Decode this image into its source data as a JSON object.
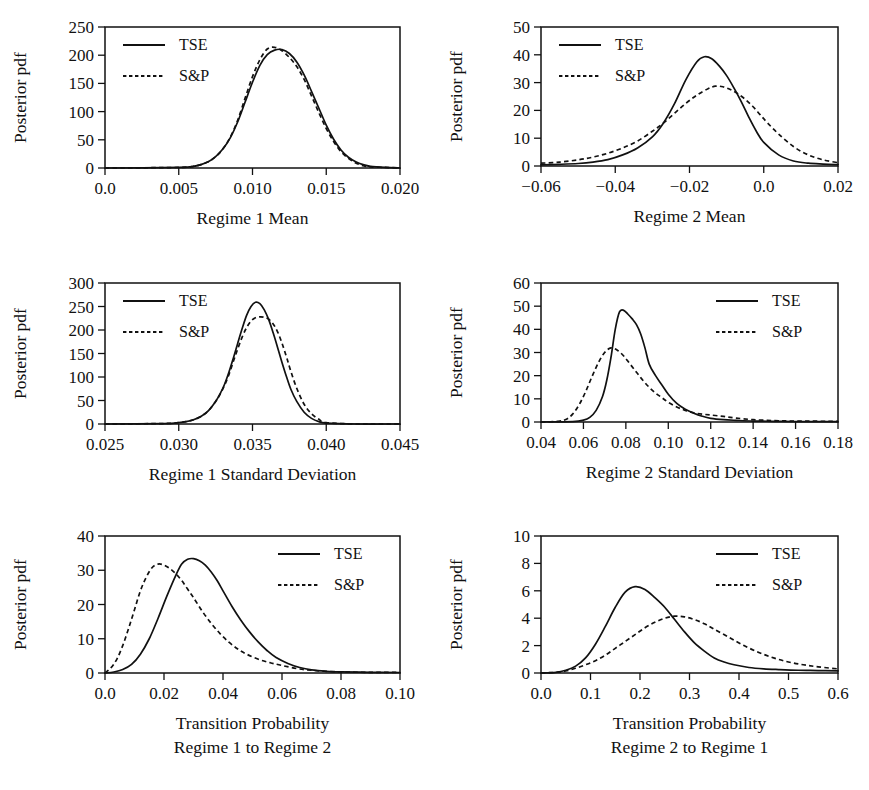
{
  "figure": {
    "ylabel": "Posterior pdf",
    "legend": {
      "series1": "TSE",
      "series2": "S&P"
    }
  },
  "chart_data": [
    {
      "id": "regime1-mean",
      "type": "line",
      "title": "",
      "xlabel": "Regime 1 Mean",
      "ylabel": "Posterior pdf",
      "xlim": [
        0.0,
        0.02
      ],
      "ylim": [
        0,
        250
      ],
      "xticks": [
        0.0,
        0.005,
        0.01,
        0.015,
        0.02
      ],
      "xticklabels": [
        "0.0",
        "0.005",
        "0.010",
        "0.015",
        "0.020"
      ],
      "yticks": [
        0,
        50,
        100,
        150,
        200,
        250
      ],
      "yticklabels": [
        "0",
        "50",
        "100",
        "150",
        "200",
        "250"
      ],
      "grid": false,
      "legend_position": "top-left",
      "series": [
        {
          "name": "TSE",
          "style": "solid",
          "x": [
            0.0,
            0.005,
            0.006,
            0.0065,
            0.007,
            0.0075,
            0.008,
            0.0085,
            0.009,
            0.0095,
            0.01,
            0.0105,
            0.011,
            0.0115,
            0.012,
            0.0125,
            0.013,
            0.0135,
            0.014,
            0.0145,
            0.015,
            0.0155,
            0.016,
            0.0165,
            0.017,
            0.0175,
            0.018,
            0.019,
            0.02
          ],
          "y": [
            0,
            1,
            3,
            6,
            11,
            20,
            34,
            54,
            82,
            117,
            152,
            182,
            201,
            209,
            210,
            203,
            188,
            165,
            136,
            106,
            76,
            51,
            32,
            19,
            11,
            6,
            3,
            1,
            0
          ]
        },
        {
          "name": "S&P",
          "style": "dashed",
          "x": [
            0.0,
            0.005,
            0.006,
            0.0065,
            0.007,
            0.0075,
            0.008,
            0.0085,
            0.009,
            0.0095,
            0.01,
            0.0105,
            0.011,
            0.0115,
            0.012,
            0.0125,
            0.013,
            0.0135,
            0.014,
            0.0145,
            0.015,
            0.0155,
            0.016,
            0.0165,
            0.017,
            0.0175,
            0.018,
            0.019,
            0.02
          ],
          "y": [
            0,
            1,
            3,
            6,
            11,
            20,
            34,
            55,
            85,
            124,
            162,
            192,
            211,
            214,
            208,
            196,
            180,
            157,
            128,
            98,
            70,
            47,
            29,
            17,
            9,
            4,
            2,
            1,
            0
          ]
        }
      ]
    },
    {
      "id": "regime2-mean",
      "type": "line",
      "title": "",
      "xlabel": "Regime 2 Mean",
      "ylabel": "Posterior pdf",
      "xlim": [
        -0.06,
        0.02
      ],
      "ylim": [
        0,
        50
      ],
      "xticks": [
        -0.06,
        -0.04,
        -0.02,
        0.0,
        0.02
      ],
      "xticklabels": [
        "−0.06",
        "−0.04",
        "−0.02",
        "0.0",
        "0.02"
      ],
      "yticks": [
        0,
        10,
        20,
        30,
        40,
        50
      ],
      "yticklabels": [
        "0",
        "10",
        "20",
        "30",
        "40",
        "50"
      ],
      "grid": false,
      "legend_position": "top-left",
      "series": [
        {
          "name": "TSE",
          "style": "solid",
          "x": [
            -0.06,
            -0.055,
            -0.05,
            -0.046,
            -0.042,
            -0.038,
            -0.034,
            -0.03,
            -0.027,
            -0.024,
            -0.021,
            -0.018,
            -0.016,
            -0.014,
            -0.012,
            -0.01,
            -0.008,
            -0.006,
            -0.004,
            -0.002,
            0.0,
            0.004,
            0.008,
            0.012,
            0.016,
            0.02
          ],
          "y": [
            0.4,
            0.6,
            0.9,
            1.4,
            2.3,
            4.0,
            6.5,
            10.5,
            15.5,
            22.5,
            31.0,
            37.5,
            39.3,
            38.6,
            36.0,
            32.5,
            28.0,
            23.0,
            17.5,
            12.5,
            8.5,
            4.0,
            1.8,
            1.0,
            0.7,
            0.5
          ]
        },
        {
          "name": "S&P",
          "style": "dashed",
          "x": [
            -0.06,
            -0.055,
            -0.05,
            -0.046,
            -0.042,
            -0.038,
            -0.034,
            -0.03,
            -0.027,
            -0.024,
            -0.021,
            -0.018,
            -0.015,
            -0.013,
            -0.011,
            -0.009,
            -0.007,
            -0.005,
            -0.003,
            -0.001,
            0.001,
            0.004,
            0.008,
            0.012,
            0.016,
            0.02
          ],
          "y": [
            1.0,
            1.4,
            2.2,
            3.2,
            4.6,
            6.5,
            9.0,
            12.5,
            15.5,
            19.0,
            22.5,
            25.5,
            27.8,
            28.7,
            28.5,
            27.5,
            26.0,
            24.0,
            21.5,
            18.5,
            15.5,
            11.5,
            7.0,
            4.0,
            2.2,
            1.2
          ]
        }
      ]
    },
    {
      "id": "regime1-sd",
      "type": "line",
      "title": "",
      "xlabel": "Regime 1 Standard Deviation",
      "ylabel": "Posterior pdf",
      "xlim": [
        0.025,
        0.045
      ],
      "ylim": [
        0,
        300
      ],
      "xticks": [
        0.025,
        0.03,
        0.035,
        0.04,
        0.045
      ],
      "xticklabels": [
        "0.025",
        "0.030",
        "0.035",
        "0.040",
        "0.045"
      ],
      "yticks": [
        0,
        50,
        100,
        150,
        200,
        250,
        300
      ],
      "yticklabels": [
        "0",
        "50",
        "100",
        "150",
        "200",
        "250",
        "300"
      ],
      "grid": false,
      "legend_position": "top-left",
      "series": [
        {
          "name": "TSE",
          "style": "solid",
          "x": [
            0.025,
            0.029,
            0.03,
            0.0305,
            0.031,
            0.0315,
            0.032,
            0.0325,
            0.0328,
            0.0331,
            0.0334,
            0.0337,
            0.034,
            0.0343,
            0.0346,
            0.0349,
            0.0352,
            0.0355,
            0.0358,
            0.0361,
            0.0364,
            0.0367,
            0.037,
            0.0373,
            0.0376,
            0.038,
            0.0385,
            0.039,
            0.0395,
            0.04,
            0.042,
            0.045
          ],
          "y": [
            0,
            1,
            3,
            5,
            9,
            16,
            28,
            48,
            64,
            84,
            110,
            140,
            172,
            203,
            231,
            250,
            259,
            256,
            243,
            222,
            194,
            163,
            131,
            101,
            74,
            48,
            25,
            12,
            5,
            2,
            0,
            0
          ]
        },
        {
          "name": "S&P",
          "style": "dashed",
          "x": [
            0.025,
            0.029,
            0.03,
            0.0305,
            0.031,
            0.0315,
            0.032,
            0.0325,
            0.0328,
            0.0331,
            0.0334,
            0.0337,
            0.034,
            0.0343,
            0.0346,
            0.0349,
            0.0352,
            0.0355,
            0.0358,
            0.0361,
            0.0364,
            0.0367,
            0.037,
            0.0373,
            0.0376,
            0.038,
            0.0385,
            0.039,
            0.0395,
            0.04,
            0.042,
            0.045
          ],
          "y": [
            0,
            1,
            3,
            5,
            9,
            16,
            28,
            48,
            63,
            82,
            105,
            133,
            160,
            185,
            205,
            219,
            226,
            228,
            227,
            223,
            213,
            196,
            172,
            143,
            112,
            76,
            42,
            22,
            10,
            3,
            0,
            0
          ]
        }
      ]
    },
    {
      "id": "regime2-sd",
      "type": "line",
      "title": "",
      "xlabel": "Regime 2 Standard Deviation",
      "ylabel": "Posterior pdf",
      "xlim": [
        0.04,
        0.18
      ],
      "ylim": [
        0,
        60
      ],
      "xticks": [
        0.04,
        0.06,
        0.08,
        0.1,
        0.12,
        0.14,
        0.16,
        0.18
      ],
      "xticklabels": [
        "0.04",
        "0.06",
        "0.08",
        "0.10",
        "0.12",
        "0.14",
        "0.16",
        "0.18"
      ],
      "yticks": [
        0,
        10,
        20,
        30,
        40,
        50,
        60
      ],
      "yticklabels": [
        "0",
        "10",
        "20",
        "30",
        "40",
        "50",
        "60"
      ],
      "grid": false,
      "legend_position": "top-right",
      "series": [
        {
          "name": "TSE",
          "style": "solid",
          "x": [
            0.04,
            0.055,
            0.06,
            0.063,
            0.066,
            0.069,
            0.071,
            0.073,
            0.075,
            0.077,
            0.079,
            0.081,
            0.083,
            0.085,
            0.087,
            0.089,
            0.091,
            0.094,
            0.097,
            0.1,
            0.104,
            0.108,
            0.112,
            0.116,
            0.12,
            0.126,
            0.132,
            0.14,
            0.15,
            0.16,
            0.18
          ],
          "y": [
            0,
            0.2,
            0.8,
            2.0,
            5.0,
            11.0,
            18.0,
            28.0,
            40.0,
            47.5,
            48.2,
            46.5,
            44.5,
            42.0,
            38.0,
            32.0,
            25.0,
            20.0,
            16.0,
            12.0,
            8.0,
            5.5,
            3.8,
            2.5,
            1.6,
            1.0,
            0.7,
            0.4,
            0.3,
            0.2,
            0.2
          ]
        },
        {
          "name": "S&P",
          "style": "dashed",
          "x": [
            0.04,
            0.048,
            0.052,
            0.055,
            0.058,
            0.061,
            0.064,
            0.067,
            0.07,
            0.073,
            0.076,
            0.079,
            0.082,
            0.085,
            0.088,
            0.091,
            0.094,
            0.097,
            0.1,
            0.104,
            0.108,
            0.112,
            0.116,
            0.12,
            0.126,
            0.132,
            0.14,
            0.15,
            0.16,
            0.18
          ],
          "y": [
            0,
            0.3,
            1.2,
            3.5,
            7.5,
            13.0,
            19.5,
            25.5,
            30.0,
            32.0,
            31.0,
            28.5,
            25.0,
            21.5,
            18.0,
            15.0,
            12.5,
            10.5,
            8.5,
            6.5,
            5.0,
            4.0,
            3.4,
            3.0,
            2.4,
            1.7,
            1.0,
            0.6,
            0.4,
            0.3
          ]
        }
      ]
    },
    {
      "id": "transition-1to2",
      "type": "line",
      "title": "",
      "xlabel": "Transition Probability",
      "xlabel2": "Regime 1 to Regime 2",
      "ylabel": "Posterior pdf",
      "xlim": [
        0.0,
        0.1
      ],
      "ylim": [
        0,
        40
      ],
      "xticks": [
        0.0,
        0.02,
        0.04,
        0.06,
        0.08,
        0.1
      ],
      "xticklabels": [
        "0.0",
        "0.02",
        "0.04",
        "0.06",
        "0.08",
        "0.10"
      ],
      "yticks": [
        0,
        10,
        20,
        30,
        40
      ],
      "yticklabels": [
        "0",
        "10",
        "20",
        "30",
        "40"
      ],
      "grid": false,
      "legend_position": "top-right",
      "series": [
        {
          "name": "TSE",
          "style": "solid",
          "x": [
            0.0,
            0.003,
            0.006,
            0.009,
            0.012,
            0.015,
            0.018,
            0.021,
            0.024,
            0.026,
            0.028,
            0.03,
            0.032,
            0.034,
            0.036,
            0.038,
            0.04,
            0.043,
            0.046,
            0.049,
            0.052,
            0.055,
            0.058,
            0.062,
            0.066,
            0.07,
            0.075,
            0.08,
            0.09,
            0.1
          ],
          "y": [
            0,
            0.3,
            1.0,
            2.5,
            5.5,
            10.0,
            16.0,
            22.5,
            28.5,
            31.8,
            33.2,
            33.4,
            32.8,
            31.5,
            29.5,
            27.0,
            24.0,
            19.5,
            15.5,
            12.0,
            9.0,
            6.5,
            4.5,
            2.8,
            1.6,
            0.9,
            0.5,
            0.3,
            0.2,
            0.15
          ]
        },
        {
          "name": "S&P",
          "style": "dashed",
          "x": [
            0.0,
            0.002,
            0.004,
            0.006,
            0.008,
            0.01,
            0.012,
            0.014,
            0.016,
            0.018,
            0.02,
            0.022,
            0.024,
            0.026,
            0.028,
            0.03,
            0.033,
            0.036,
            0.039,
            0.042,
            0.045,
            0.048,
            0.052,
            0.056,
            0.06,
            0.065,
            0.07,
            0.08,
            0.09,
            0.1
          ],
          "y": [
            0,
            1.5,
            4.0,
            8.0,
            13.0,
            18.5,
            24.0,
            28.0,
            30.8,
            31.8,
            31.5,
            30.5,
            29.0,
            27.0,
            24.5,
            22.0,
            18.0,
            14.5,
            11.5,
            9.0,
            7.0,
            5.5,
            4.0,
            3.0,
            2.2,
            1.3,
            0.8,
            0.3,
            0.2,
            0.15
          ]
        }
      ]
    },
    {
      "id": "transition-2to1",
      "type": "line",
      "title": "",
      "xlabel": "Transition Probability",
      "xlabel2": "Regime 2 to Regime 1",
      "ylabel": "Posterior pdf",
      "xlim": [
        0.0,
        0.6
      ],
      "ylim": [
        0,
        10
      ],
      "xticks": [
        0.0,
        0.1,
        0.2,
        0.3,
        0.4,
        0.5,
        0.6
      ],
      "xticklabels": [
        "0.0",
        "0.1",
        "0.2",
        "0.3",
        "0.4",
        "0.5",
        "0.6"
      ],
      "yticks": [
        0,
        2,
        4,
        6,
        8,
        10
      ],
      "yticklabels": [
        "0",
        "2",
        "4",
        "6",
        "8",
        "10"
      ],
      "grid": false,
      "legend_position": "top-right",
      "series": [
        {
          "name": "TSE",
          "style": "solid",
          "x": [
            0.0,
            0.03,
            0.05,
            0.07,
            0.09,
            0.11,
            0.13,
            0.15,
            0.17,
            0.19,
            0.21,
            0.23,
            0.25,
            0.27,
            0.29,
            0.31,
            0.33,
            0.35,
            0.37,
            0.39,
            0.42,
            0.45,
            0.48,
            0.52,
            0.56,
            0.6
          ],
          "y": [
            0,
            0.05,
            0.2,
            0.5,
            1.1,
            2.1,
            3.4,
            4.8,
            5.9,
            6.3,
            6.1,
            5.5,
            4.8,
            3.9,
            3.0,
            2.2,
            1.6,
            1.1,
            0.8,
            0.6,
            0.4,
            0.3,
            0.25,
            0.2,
            0.18,
            0.15
          ]
        },
        {
          "name": "S&P",
          "style": "dashed",
          "x": [
            0.0,
            0.03,
            0.05,
            0.07,
            0.09,
            0.11,
            0.13,
            0.15,
            0.17,
            0.19,
            0.21,
            0.23,
            0.25,
            0.27,
            0.29,
            0.31,
            0.33,
            0.35,
            0.38,
            0.41,
            0.44,
            0.47,
            0.5,
            0.53,
            0.56,
            0.6
          ],
          "y": [
            0,
            0.05,
            0.15,
            0.35,
            0.6,
            0.9,
            1.3,
            1.8,
            2.3,
            2.8,
            3.3,
            3.7,
            4.0,
            4.15,
            4.1,
            3.9,
            3.6,
            3.2,
            2.6,
            2.0,
            1.5,
            1.1,
            0.8,
            0.6,
            0.45,
            0.3
          ]
        }
      ]
    }
  ]
}
